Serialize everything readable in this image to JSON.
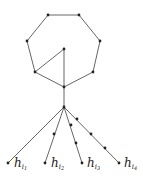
{
  "diagram": {
    "nodes": [
      {
        "id": "a",
        "x": 48,
        "y": 15
      },
      {
        "id": "b",
        "x": 79,
        "y": 15
      },
      {
        "id": "c",
        "x": 100,
        "y": 41
      },
      {
        "id": "d",
        "x": 93,
        "y": 72
      },
      {
        "id": "e",
        "x": 64,
        "y": 87
      },
      {
        "id": "f",
        "x": 35,
        "y": 72
      },
      {
        "id": "g",
        "x": 27,
        "y": 41
      },
      {
        "id": "inner",
        "x": 64,
        "y": 49
      },
      {
        "id": "hub",
        "x": 64,
        "y": 107
      },
      {
        "id": "L1",
        "x": 8,
        "y": 163
      },
      {
        "id": "L2",
        "x": 45,
        "y": 163
      },
      {
        "id": "L3",
        "x": 82,
        "y": 163
      },
      {
        "id": "L4",
        "x": 119,
        "y": 163
      },
      {
        "id": "m2a",
        "x": 54,
        "y": 134
      },
      {
        "id": "m3a",
        "x": 71,
        "y": 125
      },
      {
        "id": "m3b",
        "x": 76,
        "y": 143
      },
      {
        "id": "m4a",
        "x": 77,
        "y": 119
      },
      {
        "id": "m4b",
        "x": 91,
        "y": 134
      },
      {
        "id": "m4c",
        "x": 105,
        "y": 148
      }
    ],
    "labels": [
      {
        "base": "h",
        "sub": "i",
        "subsub": "1"
      },
      {
        "base": "h",
        "sub": "i",
        "subsub": "2"
      },
      {
        "base": "h",
        "sub": "i",
        "subsub": "3"
      },
      {
        "base": "h",
        "sub": "i",
        "subsub": "4"
      }
    ]
  }
}
